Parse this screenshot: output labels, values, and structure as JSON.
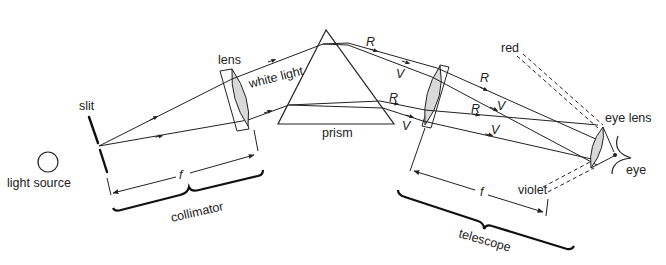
{
  "diagram": {
    "labels": {
      "light_source": "light source",
      "slit": "slit",
      "lens": "lens",
      "white_light": "white light",
      "prism": "prism",
      "collimator": "collimator",
      "focal_collimator": "f",
      "focal_telescope": "f",
      "telescope": "telescope",
      "red": "red",
      "violet": "violet",
      "eye_lens": "eye lens",
      "eye": "eye",
      "ray_R1": "R",
      "ray_V1": "V",
      "ray_R2": "R",
      "ray_V2": "V",
      "ray_R3": "R",
      "ray_V3": "V",
      "ray_R4": "R",
      "ray_V4": "V"
    },
    "colors": {
      "line": "#222222",
      "lens_fill": "#d9d9d9",
      "background": "#ffffff"
    }
  }
}
